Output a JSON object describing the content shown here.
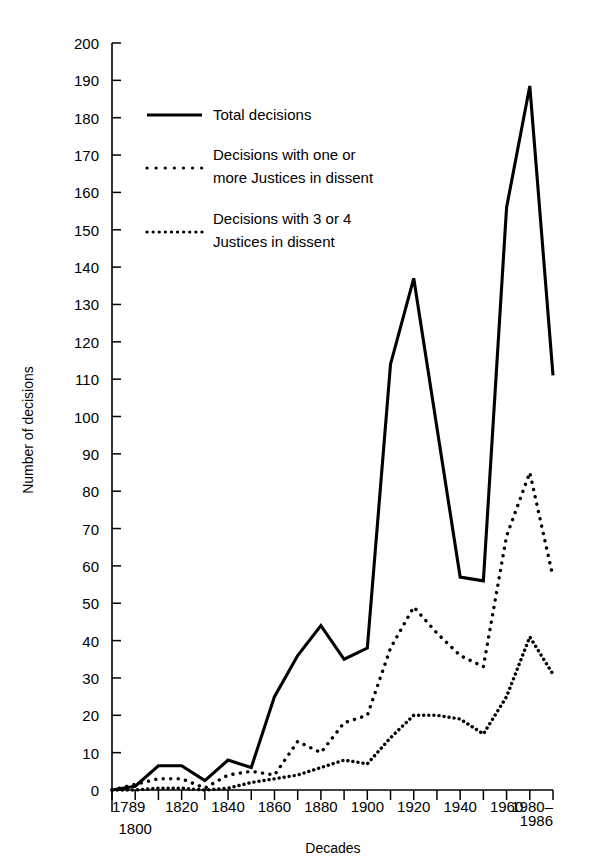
{
  "chart_data": {
    "type": "line",
    "title": "",
    "xlabel": "Decades",
    "ylabel": "Number of decisions",
    "ylim": [
      0,
      200
    ],
    "ytick_step": 10,
    "grid": false,
    "legend_position": "upper-left-inside",
    "x_tick_labels": [
      "1789",
      "1800",
      "1820",
      "1840",
      "1860",
      "1880",
      "1900",
      "1920",
      "1940",
      "1960",
      "1980–"
    ],
    "x_tick_label_extra": "1986",
    "y_tick_labels": [
      "0",
      "10",
      "20",
      "30",
      "40",
      "50",
      "60",
      "70",
      "80",
      "90",
      "100",
      "110",
      "120",
      "130",
      "140",
      "150",
      "160",
      "170",
      "180",
      "190",
      "200"
    ],
    "categories": [
      "1789",
      "1800",
      "1810",
      "1820",
      "1830",
      "1840",
      "1850",
      "1860",
      "1870",
      "1880",
      "1890",
      "1900",
      "1910",
      "1920",
      "1930",
      "1940",
      "1950",
      "1960",
      "1970",
      "1980–1986"
    ],
    "series": [
      {
        "name": "Total decisions",
        "style": "solid",
        "values": [
          0,
          1,
          6.5,
          6.5,
          2.5,
          8,
          6,
          25,
          36,
          44,
          35,
          38,
          114,
          137,
          97,
          57,
          56,
          156,
          188.5,
          111
        ]
      },
      {
        "name": "Decisions with one or more Justices in dissent",
        "style": "dotted-coarse",
        "values": [
          0,
          1.5,
          3,
          3,
          0.5,
          4,
          5,
          4,
          13,
          10,
          18,
          20,
          38,
          49,
          42,
          36,
          33,
          68,
          85,
          57
        ]
      },
      {
        "name": "Decisions with 3 or 4 Justices in dissent",
        "style": "dotted-fine",
        "values": [
          0,
          0,
          0.5,
          0.5,
          0,
          0.5,
          2,
          3,
          4,
          6,
          8,
          7,
          14,
          20,
          20,
          19,
          15,
          25,
          41,
          31
        ]
      }
    ]
  },
  "legend": {
    "items": [
      {
        "label": "Total decisions",
        "style": "solid"
      },
      {
        "label_line1": "Decisions with one or",
        "label_line2": "more Justices in dissent",
        "style": "dotted-coarse"
      },
      {
        "label_line1": "Decisions with 3 or 4",
        "label_line2": "Justices in dissent",
        "style": "dotted-fine"
      }
    ]
  },
  "axes": {
    "x_title": "Decades",
    "y_title": "Number of decisions"
  }
}
